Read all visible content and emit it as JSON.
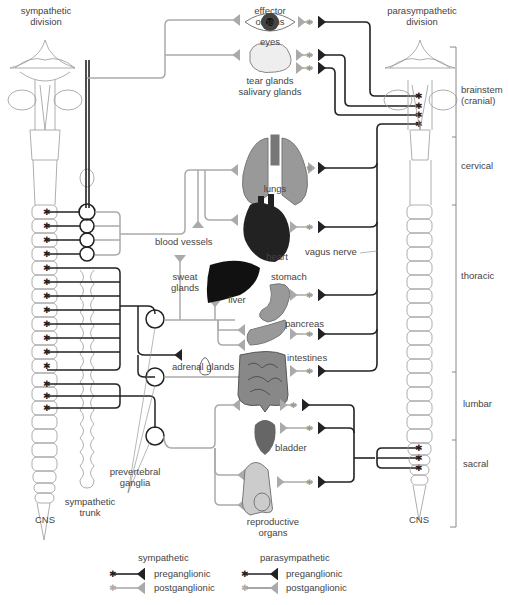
{
  "headers": {
    "sympathetic_division": [
      "sympathetic",
      "division"
    ],
    "effector_organs": [
      "effector",
      "organs"
    ],
    "parasympathetic_division": [
      "parasympathetic",
      "division"
    ]
  },
  "regions": [
    {
      "name": "brainstem",
      "lines": [
        "brainstem",
        "(cranial)"
      ]
    },
    {
      "name": "cervical",
      "lines": [
        "cervical"
      ]
    },
    {
      "name": "thoracic",
      "lines": [
        "thoracic"
      ]
    },
    {
      "name": "lumbar",
      "lines": [
        "lumbar"
      ]
    },
    {
      "name": "sacral",
      "lines": [
        "sacral"
      ]
    }
  ],
  "organs": {
    "eyes": "eyes",
    "tear_glands": [
      "tear glands",
      "salivary glands"
    ],
    "lungs": "lungs",
    "heart": "heart",
    "liver": "liver",
    "stomach": "stomach",
    "pancreas": "pancreas",
    "intestines": "intestines",
    "adrenal_glands": "adrenal glands",
    "bladder": "bladder",
    "reproductive_organs": [
      "reproductive",
      "organs"
    ]
  },
  "annotations": {
    "blood_vessels": "blood vessels",
    "sweat_glands": [
      "sweat",
      "glands"
    ],
    "vagus_nerve": "vagus nerve",
    "prevertebral_ganglia": [
      "prevertebral",
      "ganglia"
    ],
    "sympathetic_trunk": [
      "sympathetic",
      "trunk"
    ],
    "cns_left": "CNS",
    "cns_right": "CNS"
  },
  "legend": {
    "sympathetic": {
      "title": "sympathetic",
      "preganglionic": "preganglionic",
      "postganglionic": "postganglionic"
    },
    "parasympathetic": {
      "title": "parasympathetic",
      "preganglionic": "preganglionic",
      "postganglionic": "postganglionic"
    }
  },
  "colors": {
    "preganglionic": "#222222",
    "postganglionic": "#a8a8a8",
    "outline": "#888888"
  }
}
